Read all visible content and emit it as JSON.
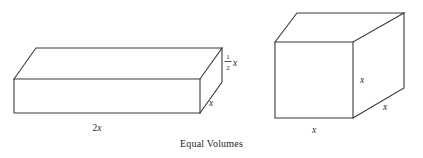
{
  "figure": {
    "caption": "Equal Volumes",
    "stroke_color": "#3a3a3a",
    "background_color": "#ffffff",
    "text_color": "#2b2b2b",
    "shapes": [
      {
        "name": "flat-rectangular-prism",
        "description": "Wide flat box (slab) drawn in oblique projection",
        "labels": {
          "width": "2x",
          "depth": "x",
          "height_numerator": "1",
          "height_denominator": "2",
          "height_variable": "x",
          "height_full": "1/2 x"
        }
      },
      {
        "name": "cube",
        "description": "Cube drawn in oblique projection",
        "labels": {
          "width": "x",
          "height": "x",
          "depth": "x"
        }
      }
    ]
  }
}
